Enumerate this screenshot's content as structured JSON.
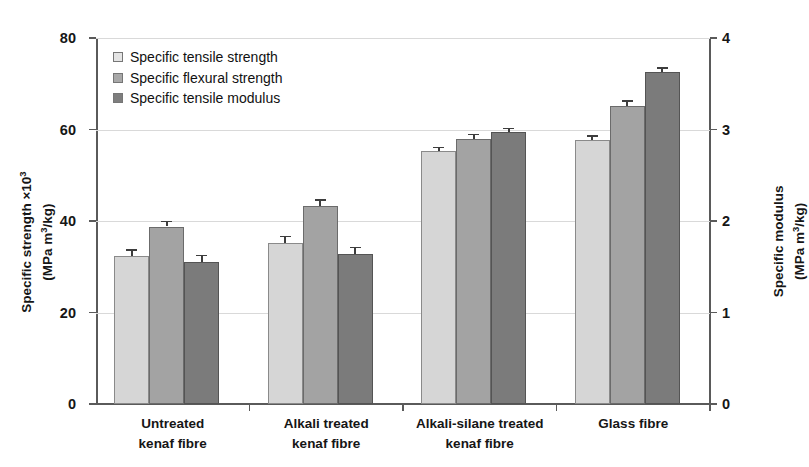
{
  "chart_data": {
    "type": "bar",
    "title": "",
    "subtitle": "",
    "categories": [
      "Untreated\nkenaf fibre",
      "Alkali treated\nkenaf fibre",
      "Alkali-silane treated\nkenaf fibre",
      "Glass fibre"
    ],
    "category_lines": [
      [
        "Untreated",
        "kenaf fibre"
      ],
      [
        "Alkali treated",
        "kenaf fibre"
      ],
      [
        "Alkali-silane treated",
        "kenaf fibre"
      ],
      [
        "Glass fibre",
        ""
      ]
    ],
    "series": [
      {
        "name": "Specific tensile strength",
        "axis": "left",
        "color": "#d6d6d6",
        "values": [
          32.3,
          35.2,
          55.2,
          57.7
        ],
        "errors": [
          1.5,
          1.6,
          1.0,
          1.1
        ]
      },
      {
        "name": "Specific flexural strength",
        "axis": "left",
        "color": "#a3a3a3",
        "values": [
          38.8,
          43.2,
          58.0,
          65.2
        ],
        "errors": [
          1.3,
          1.5,
          1.1,
          1.2
        ]
      },
      {
        "name": "Specific tensile modulus",
        "axis": "right",
        "color": "#7b7b7b",
        "values": [
          31.0,
          32.7,
          59.5,
          72.5
        ],
        "errors": [
          1.6,
          1.7,
          0.9,
          1.1
        ]
      }
    ],
    "xlabel": "",
    "ylabel": "Specific strength ×10³ (MPa m³/kg)",
    "ylabel_right": "Specific modulus (MPa m³/kg)",
    "ylim": [
      0,
      80
    ],
    "yticks": [
      0,
      20,
      40,
      60,
      80
    ],
    "ylim_right": [
      0,
      4
    ],
    "yticks_right": [
      0,
      1,
      2,
      3,
      4
    ],
    "grid": true,
    "grid_axis": "y",
    "legend_position": "upper-left",
    "legend_entries": [
      "Specific tensile strength",
      "Specific flexural strength",
      "Specific tensile modulus"
    ]
  },
  "axes": {
    "left": {
      "title_main": "Specific strength ×10",
      "title_exp": "3",
      "title_unit": "(MPa m",
      "title_unit_exp": "3",
      "title_unit_tail": "/kg)",
      "ticks": [
        "0",
        "20",
        "40",
        "60",
        "80"
      ]
    },
    "right": {
      "title_main": "Specific modulus",
      "title_unit": "(MPa m",
      "title_unit_exp": "3",
      "title_unit_tail": "/kg)",
      "ticks": [
        "0",
        "1",
        "2",
        "3",
        "4"
      ]
    }
  },
  "legend": {
    "items": [
      {
        "label": "Specific tensile strength",
        "swatch": "#e4e4e4"
      },
      {
        "label": "Specific flexural strength",
        "swatch": "#a8a8a8"
      },
      {
        "label": "Specific tensile modulus",
        "swatch": "#7e7e7e"
      }
    ]
  },
  "colors": {
    "series_1": "#d6d6d6",
    "series_2": "#a3a3a3",
    "series_3": "#7b7b7b",
    "axis": "#5a5a5a",
    "grid": "#d9d9d9",
    "text": "#161616",
    "background": "#ffffff"
  }
}
